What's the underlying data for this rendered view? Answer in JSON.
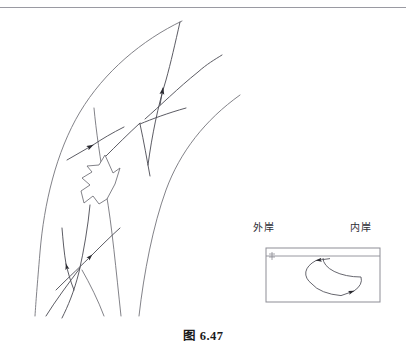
{
  "page": {
    "running_head": "",
    "caption": "图 6.47",
    "background_color": "#ffffff",
    "ink_color": "#58585f",
    "rule_color": "#9a9aa2"
  },
  "main_diagram": {
    "name": "river-bend-flow-diagram",
    "description": "curved river channel showing surface and bottom flow lines at a bend",
    "elements": {
      "outer_bank_curve": "left concave bank arc",
      "inner_bank_curve": "right bank arc",
      "mid_channel_curve": "secondary channel line",
      "flow_lines_count": 6,
      "arrowheads_count": 4,
      "block_arrow": "hollow outlined block arrow pointing upper-right"
    }
  },
  "inset": {
    "name": "cross-section-inset",
    "labels": {
      "left": "外岸",
      "right": "内岸"
    },
    "box": {
      "x": 266,
      "y": 248,
      "width": 114,
      "height": 54,
      "border_color": "#8d8d95"
    },
    "water_surface_line_y": 256,
    "circulation": {
      "shape": "ellipse",
      "direction": "counter-clockwise",
      "arrowheads": 2,
      "cx": 323,
      "cy": 277,
      "rx": 38,
      "ry": 19
    }
  }
}
